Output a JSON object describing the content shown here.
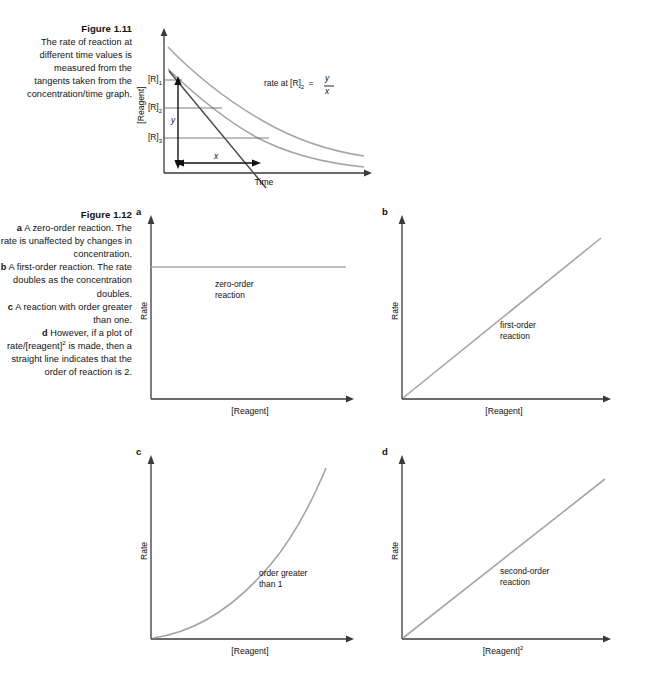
{
  "page": {
    "background": "#ffffff",
    "text_color": "#111111",
    "curve_color": "#9a9a9a",
    "axis_color": "#3a3a3a",
    "tangent_color": "#4a4a4a"
  },
  "figure_1_11": {
    "caption": {
      "title": "Figure 1.11",
      "lines": [
        "The rate of reaction at",
        "different time values is",
        "measured from the",
        "tangents taken from the",
        "concentration/time graph."
      ]
    },
    "axes": {
      "x_label": "Time",
      "y_label": "[Reagent]"
    },
    "tick_labels": {
      "r1": "[R]",
      "r1_sub": "1",
      "r2": "[R]",
      "r2_sub": "2",
      "r3": "[R]",
      "r3_sub": "3"
    },
    "annotations": {
      "rate_expression_prefix": "rate at [R]",
      "rate_expression_sub": "2",
      "rate_expression_equals": "=",
      "numerator": "y",
      "denominator": "x",
      "x_arrow_label": "x",
      "y_arrow_label": "y"
    }
  },
  "figure_1_12": {
    "caption": {
      "title": "Figure 1.12",
      "items": [
        {
          "letter": "a",
          "text": "A zero-order reaction. The rate is unaffected by changes in concentration."
        },
        {
          "letter": "b",
          "text": "A first-order reaction. The rate doubles as the concentration doubles."
        },
        {
          "letter": "c",
          "text": "A reaction with order greater than one."
        },
        {
          "letter": "d",
          "text": "However, if a plot of rate/[reagent]2 is made, then a straight line indicates that the order of reaction is 2."
        }
      ]
    },
    "panels": [
      {
        "letter": "a",
        "x_label": "[Reagent]",
        "y_label": "Rate",
        "note_lines": [
          "zero-order",
          "reaction"
        ],
        "curve_type": "constant"
      },
      {
        "letter": "b",
        "x_label": "[Reagent]",
        "y_label": "Rate",
        "note_lines": [
          "first-order",
          "reaction"
        ],
        "curve_type": "linear"
      },
      {
        "letter": "c",
        "x_label": "[Reagent]",
        "y_label": "Rate",
        "note_lines": [
          "order greater",
          "than 1"
        ],
        "curve_type": "power"
      },
      {
        "letter": "d",
        "x_label": "[Reagent]",
        "x_label_sup": "2",
        "y_label": "Rate",
        "note_lines": [
          "second-order",
          "reaction"
        ],
        "curve_type": "linear"
      }
    ]
  },
  "chart_data": [
    {
      "type": "line",
      "id": "figure-1.11",
      "title": "Figure 1.11 concentration/time graph",
      "xlabel": "Time",
      "ylabel": "[Reagent]",
      "grid": false,
      "legend": "none",
      "annotations": [
        "rate at [R]2 = y/x",
        "x",
        "y"
      ],
      "ytick_labels": [
        "[R]1",
        "[R]2",
        "[R]3"
      ],
      "series": [
        {
          "name": "concentration decay curve",
          "x": [
            0,
            0.08,
            0.17,
            0.25,
            0.33,
            0.42,
            0.5,
            0.58,
            0.67,
            0.75,
            0.83,
            0.92,
            1.0
          ],
          "y": [
            1.0,
            0.86,
            0.74,
            0.63,
            0.54,
            0.46,
            0.39,
            0.33,
            0.28,
            0.24,
            0.2,
            0.17,
            0.15
          ]
        },
        {
          "name": "tangent at [R]2",
          "x": [
            0.02,
            0.62
          ],
          "y": [
            0.82,
            -0.06
          ]
        }
      ]
    },
    {
      "type": "line",
      "id": "figure-1.12a",
      "title": "zero-order reaction",
      "xlabel": "[Reagent]",
      "ylabel": "Rate",
      "grid": false,
      "legend": "none",
      "series": [
        {
          "name": "zero-order",
          "x": [
            0,
            1
          ],
          "y": [
            0.72,
            0.72
          ]
        }
      ]
    },
    {
      "type": "line",
      "id": "figure-1.12b",
      "title": "first-order reaction",
      "xlabel": "[Reagent]",
      "ylabel": "Rate",
      "grid": false,
      "legend": "none",
      "series": [
        {
          "name": "first-order",
          "x": [
            0,
            1
          ],
          "y": [
            0,
            0.96
          ]
        }
      ]
    },
    {
      "type": "line",
      "id": "figure-1.12c",
      "title": "order greater than 1",
      "xlabel": "[Reagent]",
      "ylabel": "Rate",
      "grid": false,
      "legend": "none",
      "series": [
        {
          "name": "order greater than 1",
          "x": [
            0,
            0.1,
            0.2,
            0.3,
            0.4,
            0.5,
            0.6,
            0.7,
            0.8,
            0.9,
            1.0
          ],
          "y": [
            0.0,
            0.025,
            0.06,
            0.11,
            0.17,
            0.25,
            0.35,
            0.47,
            0.62,
            0.8,
            1.0
          ]
        }
      ]
    },
    {
      "type": "line",
      "id": "figure-1.12d",
      "title": "second-order reaction",
      "xlabel": "[Reagent]2",
      "ylabel": "Rate",
      "grid": false,
      "legend": "none",
      "series": [
        {
          "name": "second-order",
          "x": [
            0,
            1
          ],
          "y": [
            0,
            0.92
          ]
        }
      ]
    }
  ]
}
